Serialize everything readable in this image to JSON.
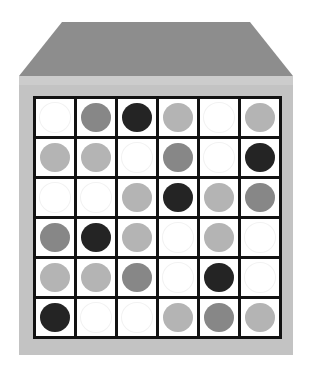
{
  "scene": {
    "title": "Grid Box",
    "description": "Perspective box with a 6 by 6 grid of colored discs on its front face",
    "canvas": {
      "width": 312,
      "height": 379
    },
    "colors": {
      "background": "#ffffff",
      "box_top_face": "#8d8d8d",
      "box_front_face": "#c3c3c3",
      "box_front_lip": "#cccccc",
      "grid_line": "#121212",
      "cell_background": "#ffffff",
      "disc_white": "#ffffff",
      "disc_light": "#b4b4b4",
      "disc_medium": "#878787",
      "disc_black": "#242424"
    }
  },
  "grid": {
    "rows": 6,
    "columns": 6,
    "tone_legend": [
      {
        "key": "white",
        "label": "White",
        "hex": "#ffffff"
      },
      {
        "key": "light",
        "label": "Light Gray",
        "hex": "#b4b4b4"
      },
      {
        "key": "medium",
        "label": "Medium Gray",
        "hex": "#878787"
      },
      {
        "key": "black",
        "label": "Black",
        "hex": "#242424"
      }
    ],
    "cells": [
      [
        "white",
        "medium",
        "black",
        "light",
        "white",
        "light"
      ],
      [
        "light",
        "light",
        "white",
        "medium",
        "white",
        "black"
      ],
      [
        "white",
        "white",
        "light",
        "black",
        "light",
        "medium"
      ],
      [
        "medium",
        "black",
        "light",
        "white",
        "light",
        "white"
      ],
      [
        "light",
        "light",
        "medium",
        "white",
        "black",
        "white"
      ],
      [
        "black",
        "white",
        "white",
        "light",
        "medium",
        "light"
      ]
    ]
  },
  "chart_data": {
    "type": "heatmap",
    "xlabel": "",
    "ylabel": "",
    "categories": [
      "C1",
      "C2",
      "C3",
      "C4",
      "C5",
      "C6"
    ],
    "rows": [
      "R1",
      "R2",
      "R3",
      "R4",
      "R5",
      "R6"
    ],
    "legend": [
      "white",
      "light",
      "medium",
      "black"
    ],
    "values": [
      [
        0,
        2,
        3,
        1,
        0,
        1
      ],
      [
        1,
        1,
        0,
        2,
        0,
        3
      ],
      [
        0,
        0,
        1,
        3,
        1,
        2
      ],
      [
        2,
        3,
        1,
        0,
        1,
        0
      ],
      [
        1,
        1,
        2,
        0,
        3,
        0
      ],
      [
        3,
        0,
        0,
        1,
        2,
        1
      ]
    ]
  }
}
